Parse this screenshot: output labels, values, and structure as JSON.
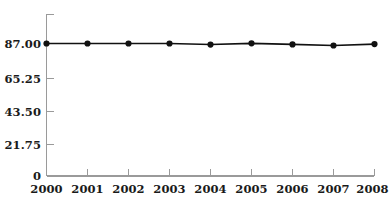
{
  "chart_data": {
    "type": "line",
    "title": "",
    "subtitle": "",
    "xlabel": "",
    "ylabel": "",
    "categories": [
      "2000",
      "2001",
      "2002",
      "2003",
      "2004",
      "2005",
      "2006",
      "2007",
      "2008"
    ],
    "values": [
      87.0,
      87.0,
      87.0,
      87.0,
      86.3,
      87.1,
      86.4,
      85.7,
      86.6
    ],
    "series": [
      {
        "name": "",
        "values": [
          87.0,
          87.0,
          87.0,
          87.0,
          86.3,
          87.1,
          86.4,
          85.7,
          86.6
        ]
      }
    ],
    "ylim": [
      0,
      94
    ],
    "xlim": [
      "2000",
      "2008"
    ],
    "y_ticks": [
      0,
      21.75,
      43.5,
      65.25,
      87.0
    ],
    "y_tick_labels": [
      "0",
      "21.75",
      "43.50",
      "65.25",
      "87.00"
    ],
    "x_ticks": [
      "2000",
      "2001",
      "2002",
      "2003",
      "2004",
      "2005",
      "2006",
      "2007",
      "2008"
    ],
    "grid": false,
    "legend": false,
    "legend_position": "none",
    "marker": "circle",
    "colors": {
      "line": "#111111",
      "marker": "#111111",
      "axis": "#9a9a9a",
      "text": "#1a1a1a",
      "background": "#ffffff"
    }
  }
}
